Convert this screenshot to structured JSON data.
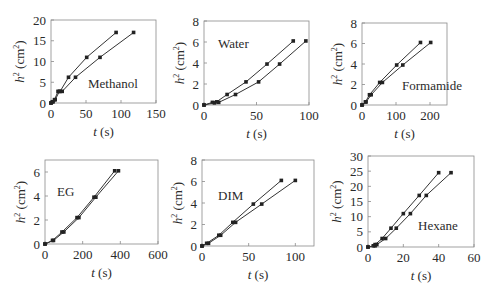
{
  "figure": {
    "xlabel": "t (s)",
    "ylabel": "h² (cm²)"
  },
  "chart_data": [
    {
      "type": "line",
      "title": "Methanol",
      "annotation": "Methanol",
      "xlabel": "t (s)",
      "ylabel": "h² (cm²)",
      "xlim": [
        0,
        150
      ],
      "ylim": [
        0,
        20
      ],
      "xticks": [
        0,
        50,
        100,
        150
      ],
      "yticks": [
        0,
        5,
        10,
        15,
        20
      ],
      "grid": false,
      "box": {
        "x0": 51,
        "x1": 156,
        "y0": 20,
        "y1": 103
      },
      "annot_pos": {
        "x": 88,
        "y": 88
      },
      "series": [
        {
          "name": "series-1",
          "x": [
            0,
            2,
            5,
            10,
            13,
            25,
            51,
            93
          ],
          "y": [
            0,
            0.3,
            0.8,
            2.8,
            2.8,
            6.2,
            11,
            17
          ]
        },
        {
          "name": "series-2",
          "x": [
            0,
            3,
            6,
            12,
            16,
            35,
            70,
            118
          ],
          "y": [
            0,
            0.3,
            0.8,
            2.8,
            2.8,
            6.2,
            11,
            17
          ]
        }
      ]
    },
    {
      "type": "line",
      "title": "Water",
      "annotation": "Water",
      "xlabel": "t (s)",
      "ylabel": "h² (cm²)",
      "xlim": [
        0,
        100
      ],
      "ylim": [
        0,
        8
      ],
      "xticks": [
        0,
        50,
        100
      ],
      "yticks": [
        0,
        2,
        4,
        6,
        8
      ],
      "grid": false,
      "box": {
        "x0": 204,
        "x1": 309,
        "y0": 21,
        "y1": 105
      },
      "annot_pos": {
        "x": 218,
        "y": 48
      },
      "series": [
        {
          "name": "series-1",
          "x": [
            0,
            8,
            12,
            22,
            40,
            60,
            85
          ],
          "y": [
            0,
            0.25,
            0.3,
            1.0,
            2.2,
            3.9,
            6.1
          ]
        },
        {
          "name": "series-2",
          "x": [
            0,
            10,
            14,
            30,
            52,
            72,
            97
          ],
          "y": [
            0,
            0.2,
            0.25,
            1.0,
            2.2,
            3.9,
            6.1
          ]
        }
      ]
    },
    {
      "type": "line",
      "title": "Formamide",
      "annotation": "Formamide",
      "xlabel": "t (s)",
      "ylabel": "h² (cm²)",
      "xlim": [
        0,
        250
      ],
      "ylim": [
        0,
        8
      ],
      "xticks": [
        0,
        100,
        200
      ],
      "yticks": [
        0,
        2,
        4,
        6,
        8
      ],
      "grid": false,
      "box": {
        "x0": 362,
        "x1": 447,
        "y0": 23,
        "y1": 105
      },
      "annot_pos": {
        "x": 402,
        "y": 90
      },
      "series": [
        {
          "name": "series-1",
          "x": [
            0,
            10,
            22,
            52,
            102,
            172
          ],
          "y": [
            0,
            0.3,
            1.0,
            2.2,
            3.9,
            6.1
          ]
        },
        {
          "name": "series-2",
          "x": [
            0,
            12,
            27,
            60,
            120,
            202
          ],
          "y": [
            0,
            0.3,
            1.0,
            2.2,
            3.9,
            6.1
          ]
        }
      ]
    },
    {
      "type": "line",
      "title": "EG",
      "annotation": "EG",
      "xlabel": "t (s)",
      "ylabel": "h² (cm²)",
      "xlim": [
        0,
        600
      ],
      "ylim": [
        0,
        7
      ],
      "xticks": [
        0,
        200,
        400,
        600
      ],
      "yticks": [
        0,
        2,
        4,
        6
      ],
      "grid": false,
      "box": {
        "x0": 45,
        "x1": 158,
        "y0": 160,
        "y1": 244
      },
      "annot_pos": {
        "x": 57,
        "y": 196
      },
      "series": [
        {
          "name": "series-1",
          "x": [
            0,
            40,
            90,
            170,
            260,
            370
          ],
          "y": [
            0,
            0.3,
            1.0,
            2.2,
            3.9,
            6.1
          ]
        },
        {
          "name": "series-2",
          "x": [
            0,
            45,
            100,
            180,
            270,
            390
          ],
          "y": [
            0,
            0.3,
            1.0,
            2.2,
            3.9,
            6.1
          ]
        }
      ]
    },
    {
      "type": "line",
      "title": "DIM",
      "annotation": "DIM",
      "xlabel": "t (s)",
      "ylabel": "h² (cm²)",
      "xlim": [
        0,
        120
      ],
      "ylim": [
        0,
        8
      ],
      "xticks": [
        0,
        50,
        100
      ],
      "yticks": [
        0,
        2,
        4,
        6,
        8
      ],
      "grid": false,
      "box": {
        "x0": 202,
        "x1": 314,
        "y0": 160,
        "y1": 246
      },
      "annot_pos": {
        "x": 218,
        "y": 200
      },
      "series": [
        {
          "name": "series-1",
          "x": [
            0,
            5,
            18,
            33,
            55,
            85
          ],
          "y": [
            0,
            0.25,
            1.0,
            2.2,
            3.9,
            6.1
          ]
        },
        {
          "name": "series-2",
          "x": [
            0,
            7,
            20,
            36,
            64,
            100
          ],
          "y": [
            0,
            0.25,
            1.0,
            2.2,
            3.9,
            6.1
          ]
        }
      ]
    },
    {
      "type": "line",
      "title": "Hexane",
      "annotation": "Hexane",
      "xlabel": "t (s)",
      "ylabel": "h² (cm²)",
      "xlim": [
        0,
        60
      ],
      "ylim": [
        0,
        30
      ],
      "xticks": [
        0,
        20,
        40,
        60
      ],
      "yticks": [
        0,
        5,
        10,
        15,
        20,
        25,
        30
      ],
      "grid": false,
      "box": {
        "x0": 368,
        "x1": 474,
        "y0": 156,
        "y1": 247
      },
      "annot_pos": {
        "x": 418,
        "y": 230
      },
      "series": [
        {
          "name": "series-1",
          "x": [
            0,
            3,
            4,
            8,
            13,
            20,
            29,
            40
          ],
          "y": [
            0,
            0.4,
            0.8,
            2.8,
            6.2,
            11,
            17,
            24.5
          ]
        },
        {
          "name": "series-2",
          "x": [
            0,
            4,
            5,
            10,
            16,
            24,
            33,
            47
          ],
          "y": [
            0,
            0.4,
            0.8,
            2.8,
            6.2,
            11,
            17,
            24.5
          ]
        }
      ]
    }
  ]
}
